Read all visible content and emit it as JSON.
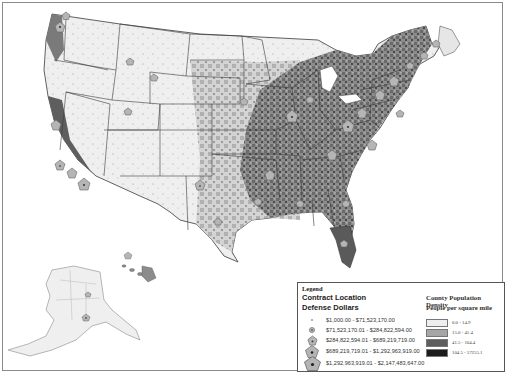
{
  "map": {
    "subject": "Defense contract locations by county population density, United States",
    "regions_shown": [
      "Contiguous United States",
      "Alaska",
      "Hawaii"
    ]
  },
  "legend": {
    "title": "Legend",
    "contract_heading": "Contract Location",
    "dollars_heading": "Defense Dollars",
    "contract_classes": [
      {
        "label": "$1,000.00 - $71,523,170.00",
        "size": "xs"
      },
      {
        "label": "$71,523,170.01 - $284,822,594.00",
        "size": "s"
      },
      {
        "label": "$284,822,594.01 - $689,219,719.00",
        "size": "m"
      },
      {
        "label": "$689,219,719.01 - $1,292,963,919.00",
        "size": "l"
      },
      {
        "label": "$1,292,963,919.01 - $2,147,483,647.00",
        "size": "xl"
      }
    ],
    "density_heading": "County Population Density",
    "density_subheading": "People per square mile",
    "density_classes": [
      {
        "label": "0.0 - 14.9",
        "color": "#eeeeee"
      },
      {
        "label": "15.0 - 41.4",
        "color": "#a6a6a6"
      },
      {
        "label": "41.5 - 104.4",
        "color": "#5e5e5e"
      },
      {
        "label": "104.5 - 57255.1",
        "color": "#1c1c1c"
      }
    ]
  },
  "colors": {
    "frame": "#8a8a8a",
    "state_border": "#3a3a3a",
    "marker_fill": "#b5b5b5",
    "marker_stroke": "#666666"
  }
}
